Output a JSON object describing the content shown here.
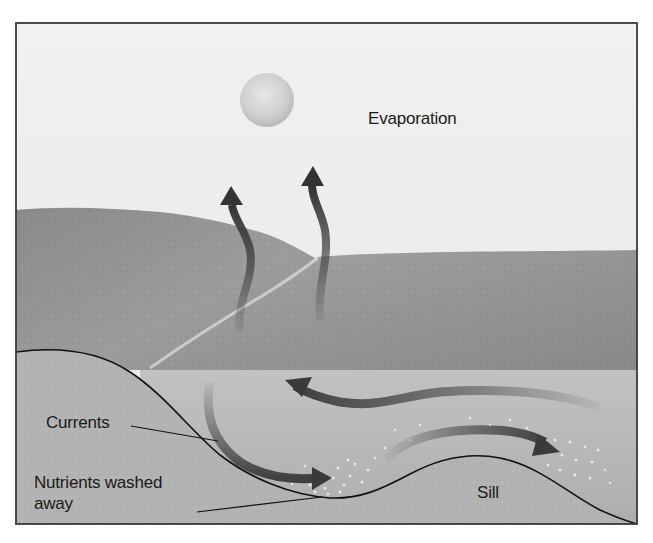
{
  "diagram": {
    "labels": {
      "evaporation": "Evaporation",
      "currents": "Currents",
      "nutrients": "Nutrients washed away",
      "sill": "Sill"
    },
    "elements": {
      "sun": "sun-icon",
      "evaporation_arrows": 2,
      "current_arrows": 3
    },
    "colors": {
      "sky": "#ececec",
      "land": "#8f8f8f",
      "land_light": "#b5b5b5",
      "water": "#b9b9b9",
      "seabed_line": "#111111",
      "arrow": "#4a4a4a",
      "frame": "#3a3a3a"
    }
  }
}
